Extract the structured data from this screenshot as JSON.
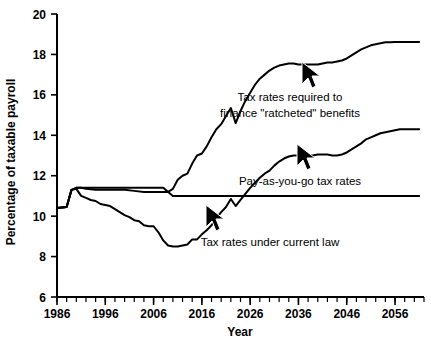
{
  "chart_data": {
    "type": "line",
    "title": "",
    "xlabel": "Year",
    "ylabel": "Percentage of taxable payroll",
    "xlim": [
      1986,
      2062
    ],
    "ylim": [
      6,
      20
    ],
    "grid": false,
    "legend_position": "inline-annotations",
    "x_major_ticks": [
      1986,
      1996,
      2006,
      2016,
      2026,
      2036,
      2046,
      2056
    ],
    "x_tick_labels": [
      "1986",
      "1996",
      "2006",
      "2016",
      "2026",
      "2036",
      "2046",
      "2056"
    ],
    "x_minor_tick_interval": 2,
    "y_major_ticks": [
      6,
      8,
      10,
      12,
      14,
      16,
      18,
      20
    ],
    "y_tick_labels": [
      "6",
      "8",
      "10",
      "12",
      "14",
      "16",
      "18",
      "20"
    ],
    "series": [
      {
        "name": "Tax rates required to finance \"ratcheted\" benefits",
        "x": [
          1986,
          1988,
          1989,
          1990,
          1991,
          1992,
          1994,
          1996,
          1998,
          2000,
          2002,
          2004,
          2006,
          2008,
          2009,
          2010,
          2011,
          2012,
          2013,
          2014,
          2015,
          2016,
          2017,
          2018,
          2019,
          2020,
          2021,
          2022,
          2023,
          2024,
          2025,
          2026,
          2027,
          2028,
          2029,
          2030,
          2031,
          2032,
          2033,
          2034,
          2035,
          2036,
          2037,
          2038,
          2039,
          2040,
          2041,
          2042,
          2043,
          2044,
          2045,
          2046,
          2047,
          2048,
          2049,
          2050,
          2051,
          2052,
          2053,
          2054,
          2055,
          2056,
          2057,
          2058,
          2059,
          2060,
          2061
        ],
        "y": [
          10.4,
          10.45,
          11.3,
          11.4,
          11.4,
          11.35,
          11.3,
          11.3,
          11.3,
          11.3,
          11.25,
          11.2,
          11.2,
          11.2,
          11.2,
          11.35,
          11.8,
          12.0,
          12.1,
          12.6,
          13.0,
          13.1,
          13.45,
          13.9,
          14.3,
          14.55,
          14.95,
          15.35,
          14.6,
          15.2,
          15.7,
          16.1,
          16.5,
          16.8,
          17.0,
          17.2,
          17.35,
          17.45,
          17.5,
          17.55,
          17.55,
          17.5,
          17.5,
          17.5,
          17.5,
          17.5,
          17.55,
          17.6,
          17.6,
          17.65,
          17.7,
          17.8,
          17.95,
          18.1,
          18.25,
          18.35,
          18.45,
          18.5,
          18.55,
          18.6,
          18.6,
          18.62,
          18.62,
          18.62,
          18.62,
          18.62,
          18.62
        ]
      },
      {
        "name": "Pay-as-you-go tax rates",
        "x": [
          1986,
          1988,
          1989,
          1990,
          1991,
          1992,
          1993,
          1994,
          1995,
          1996,
          1997,
          1998,
          1999,
          2000,
          2001,
          2002,
          2003,
          2004,
          2005,
          2006,
          2007,
          2008,
          2009,
          2010,
          2011,
          2012,
          2013,
          2014,
          2015,
          2016,
          2017,
          2018,
          2019,
          2020,
          2021,
          2022,
          2023,
          2024,
          2025,
          2026,
          2027,
          2028,
          2029,
          2030,
          2031,
          2032,
          2033,
          2034,
          2035,
          2036,
          2037,
          2038,
          2039,
          2040,
          2041,
          2042,
          2043,
          2044,
          2045,
          2046,
          2047,
          2048,
          2049,
          2050,
          2051,
          2052,
          2053,
          2054,
          2055,
          2056,
          2057,
          2058,
          2059,
          2060,
          2061
        ],
        "y": [
          10.4,
          10.45,
          11.3,
          11.35,
          11.0,
          10.9,
          10.8,
          10.75,
          10.6,
          10.55,
          10.5,
          10.35,
          10.2,
          10.05,
          9.95,
          9.8,
          9.75,
          9.55,
          9.5,
          9.5,
          9.2,
          8.8,
          8.55,
          8.5,
          8.5,
          8.55,
          8.6,
          8.85,
          8.85,
          9.1,
          9.3,
          9.55,
          9.9,
          10.2,
          10.45,
          10.85,
          10.5,
          10.8,
          11.1,
          11.4,
          11.65,
          11.9,
          12.1,
          12.25,
          12.5,
          12.7,
          12.85,
          12.95,
          13.0,
          13.0,
          13.0,
          13.0,
          13.0,
          13.05,
          13.05,
          13.05,
          13.0,
          13.0,
          13.05,
          13.15,
          13.3,
          13.45,
          13.6,
          13.8,
          13.9,
          14.0,
          14.1,
          14.15,
          14.2,
          14.25,
          14.3,
          14.3,
          14.3,
          14.3,
          14.3
        ]
      },
      {
        "name": "Tax rates under current law",
        "x": [
          1986,
          1988,
          1989,
          1990,
          1991,
          2008,
          2010,
          2061
        ],
        "y": [
          10.4,
          10.45,
          11.3,
          11.4,
          11.4,
          11.4,
          11.0,
          11.0
        ]
      }
    ],
    "annotations": [
      {
        "label": "Tax rates required to finance \"ratcheted\" benefits",
        "line1": "Tax rates required to",
        "line2": "finance \"ratcheted\" benefits",
        "pointer": "cursor-arrow"
      },
      {
        "label": "Pay-as-you-go tax rates",
        "line1": "Pay-as-you-go tax rates",
        "line2": "",
        "pointer": "cursor-arrow"
      },
      {
        "label": "Tax rates under current law",
        "line1": "Tax rates under current law",
        "line2": "",
        "pointer": "cursor-arrow"
      }
    ],
    "colors": {
      "line": "#000000",
      "axis": "#000000",
      "background": "#ffffff"
    }
  }
}
